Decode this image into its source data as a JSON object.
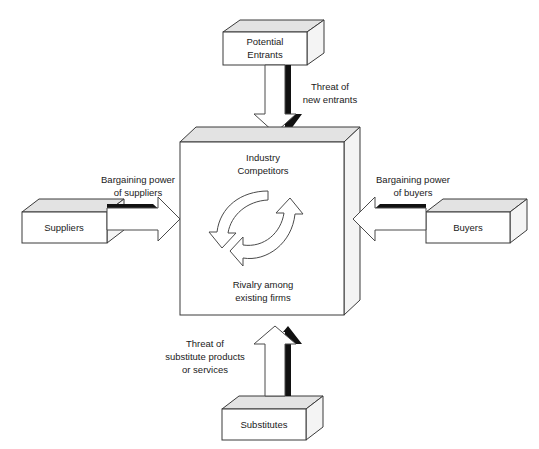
{
  "diagram": {
    "type": "five-forces",
    "colors": {
      "box_face": "#ffffff",
      "box_top": "#e3e3e3",
      "box_side": "#f4f4f4",
      "outline": "#3a3a3a",
      "arrow_fill": "#ffffff",
      "arrow_shadow": "#111111",
      "text": "#1a1a1a",
      "background": "#ffffff"
    },
    "center": {
      "name": "industry-competitors",
      "title_line1": "Industry",
      "title_line2": "Competitors",
      "subtitle_line1": "Rivalry among",
      "subtitle_line2": "existing firms"
    },
    "nodes": [
      {
        "name": "potential-entrants",
        "position": "top",
        "label_line1": "Potential",
        "label_line2": "Entrants"
      },
      {
        "name": "suppliers",
        "position": "left",
        "label_line1": "Suppliers",
        "label_line2": ""
      },
      {
        "name": "buyers",
        "position": "right",
        "label_line1": "Buyers",
        "label_line2": ""
      },
      {
        "name": "substitutes",
        "position": "bottom",
        "label_line1": "Substitutes",
        "label_line2": ""
      }
    ],
    "forces": [
      {
        "name": "threat-of-new-entrants",
        "from": "potential-entrants",
        "to": "industry-competitors",
        "direction": "down",
        "label_line1": "Threat of",
        "label_line2": "new entrants",
        "label_line3": ""
      },
      {
        "name": "bargaining-power-of-suppliers",
        "from": "suppliers",
        "to": "industry-competitors",
        "direction": "right",
        "label_line1": "Bargaining power",
        "label_line2": "of suppliers",
        "label_line3": ""
      },
      {
        "name": "bargaining-power-of-buyers",
        "from": "buyers",
        "to": "industry-competitors",
        "direction": "left",
        "label_line1": "Bargaining power",
        "label_line2": "of buyers",
        "label_line3": ""
      },
      {
        "name": "threat-of-substitutes",
        "from": "substitutes",
        "to": "industry-competitors",
        "direction": "up",
        "label_line1": "Threat of",
        "label_line2": "substitute products",
        "label_line3": "or services"
      }
    ]
  }
}
